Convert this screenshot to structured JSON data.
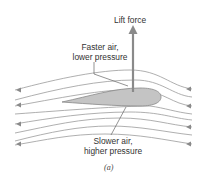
{
  "diagram": {
    "type": "airfoil-lift",
    "labels": {
      "lift": "Lift force",
      "top_line1": "Faster air,",
      "top_line2": "lower pressure",
      "bottom_line1": "Slower air,",
      "bottom_line2": "higher pressure",
      "caption": "(a)"
    },
    "colors": {
      "airfoil_fill": "#c4c4c4",
      "airfoil_stroke": "#888888",
      "streamline": "#9a9a9a",
      "arrow": "#8a8a8a",
      "text": "#333333"
    },
    "streamline_count": 8,
    "flow_direction": "right-to-left"
  }
}
